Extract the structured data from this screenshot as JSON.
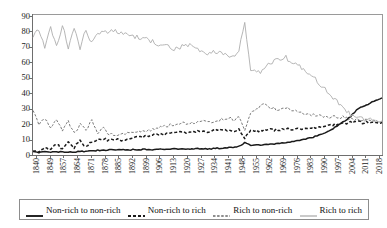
{
  "chart_data": {
    "type": "line",
    "title": "",
    "xlabel": "",
    "ylabel": "",
    "ylim": [
      0,
      90
    ],
    "ytick_values": [
      0,
      10,
      20,
      30,
      40,
      50,
      60,
      70,
      80,
      90
    ],
    "xlim": [
      1840,
      2018
    ],
    "grid": false,
    "legend_position": "bottom",
    "xtick_labels": [
      "1840",
      "1849",
      "1857",
      "1864",
      "1871",
      "1878",
      "1885",
      "1892",
      "1899",
      "1906",
      "1913",
      "1920",
      "1927",
      "1934",
      "1941",
      "1948",
      "1955",
      "1962",
      "1969",
      "1976",
      "1983",
      "1990",
      "1997",
      "2004",
      "2011",
      "2018"
    ],
    "series": [
      {
        "name": "Non-rich to non-rich",
        "style": "solid-thick-dark",
        "color": "#1a1a1a",
        "x": [
          1840,
          1843,
          1846,
          1849,
          1852,
          1855,
          1858,
          1861,
          1864,
          1867,
          1870,
          1873,
          1876,
          1879,
          1882,
          1885,
          1888,
          1891,
          1894,
          1897,
          1900,
          1903,
          1906,
          1909,
          1912,
          1915,
          1918,
          1921,
          1924,
          1927,
          1930,
          1933,
          1936,
          1939,
          1942,
          1945,
          1948,
          1951,
          1954,
          1957,
          1960,
          1963,
          1966,
          1969,
          1972,
          1975,
          1978,
          1981,
          1984,
          1987,
          1990,
          1993,
          1996,
          1999,
          2002,
          2005,
          2008,
          2011,
          2014,
          2018
        ],
        "values": [
          2.0,
          1.8,
          1.9,
          2.0,
          1.8,
          2.0,
          1.9,
          2.1,
          2.2,
          2.4,
          2.6,
          3.0,
          3.2,
          3.3,
          3.2,
          3.4,
          3.3,
          3.5,
          3.4,
          3.6,
          3.5,
          3.7,
          3.6,
          3.8,
          3.9,
          4.0,
          3.8,
          4.0,
          4.1,
          4.2,
          4.0,
          4.3,
          4.4,
          4.6,
          5.0,
          5.4,
          8.0,
          6.2,
          6.4,
          6.6,
          6.8,
          7.0,
          7.4,
          8.0,
          8.6,
          9.4,
          10.2,
          11.0,
          12.0,
          13.5,
          15.0,
          17.0,
          19.5,
          22.0,
          25.0,
          29.0,
          31.5,
          33.0,
          35.0,
          37.0
        ]
      },
      {
        "name": "Non-rich to rich",
        "style": "dashed-thick-dark",
        "color": "#1a1a1a",
        "x": [
          1840,
          1843,
          1846,
          1849,
          1852,
          1855,
          1858,
          1861,
          1864,
          1867,
          1870,
          1873,
          1876,
          1879,
          1882,
          1885,
          1888,
          1891,
          1894,
          1897,
          1900,
          1903,
          1906,
          1909,
          1912,
          1915,
          1918,
          1921,
          1924,
          1927,
          1930,
          1933,
          1936,
          1939,
          1942,
          1945,
          1948,
          1951,
          1954,
          1957,
          1960,
          1963,
          1966,
          1969,
          1972,
          1975,
          1978,
          1981,
          1984,
          1987,
          1990,
          1993,
          1996,
          1999,
          2002,
          2005,
          2008,
          2011,
          2014,
          2018
        ],
        "values": [
          3.0,
          2.0,
          5.0,
          3.5,
          7.0,
          4.0,
          8.0,
          5.0,
          9.0,
          5.5,
          8.5,
          9.5,
          10.5,
          9.5,
          10.0,
          9.5,
          10.5,
          11.0,
          11.5,
          12.0,
          12.5,
          13.5,
          13.0,
          14.0,
          14.5,
          15.0,
          14.0,
          15.0,
          15.5,
          16.0,
          15.0,
          16.0,
          16.5,
          16.0,
          15.5,
          16.5,
          11.0,
          16.0,
          15.5,
          16.0,
          16.5,
          16.0,
          16.5,
          17.0,
          16.5,
          17.0,
          17.0,
          17.5,
          18.0,
          18.5,
          19.0,
          19.5,
          20.0,
          20.5,
          21.0,
          21.5,
          21.0,
          21.5,
          21.0,
          21.0
        ]
      },
      {
        "name": "Rich to non-rich",
        "style": "dashed-thin-gray",
        "color": "#6a6a6a",
        "x": [
          1840,
          1843,
          1846,
          1849,
          1852,
          1855,
          1858,
          1861,
          1864,
          1867,
          1870,
          1873,
          1876,
          1879,
          1882,
          1885,
          1888,
          1891,
          1894,
          1897,
          1900,
          1903,
          1906,
          1909,
          1912,
          1915,
          1918,
          1921,
          1924,
          1927,
          1930,
          1933,
          1936,
          1939,
          1942,
          1945,
          1948,
          1951,
          1954,
          1957,
          1960,
          1963,
          1966,
          1969,
          1972,
          1975,
          1978,
          1981,
          1984,
          1987,
          1990,
          1993,
          1996,
          1999,
          2002,
          2005,
          2008,
          2011,
          2014,
          2018
        ],
        "values": [
          28.0,
          20.0,
          24.0,
          17.0,
          23.0,
          15.0,
          22.0,
          14.0,
          20.0,
          16.0,
          22.0,
          14.0,
          18.0,
          13.0,
          13.5,
          13.0,
          14.0,
          14.5,
          15.0,
          15.5,
          16.0,
          17.0,
          18.0,
          19.0,
          20.0,
          21.0,
          20.0,
          21.0,
          22.0,
          23.0,
          21.0,
          22.0,
          23.0,
          24.0,
          23.0,
          24.5,
          15.0,
          27.0,
          30.0,
          33.0,
          31.0,
          30.0,
          29.0,
          31.0,
          29.0,
          28.0,
          27.0,
          26.0,
          25.5,
          25.0,
          24.0,
          24.5,
          25.0,
          24.0,
          23.5,
          23.0,
          22.5,
          22.0,
          22.0,
          22.0
        ]
      },
      {
        "name": "Rich to rich",
        "style": "solid-thin-lightgray",
        "color": "#aeaeae",
        "x": [
          1840,
          1843,
          1846,
          1849,
          1852,
          1855,
          1858,
          1861,
          1864,
          1867,
          1870,
          1873,
          1876,
          1879,
          1882,
          1885,
          1888,
          1891,
          1894,
          1897,
          1900,
          1903,
          1906,
          1909,
          1912,
          1915,
          1918,
          1921,
          1924,
          1927,
          1930,
          1933,
          1936,
          1939,
          1942,
          1945,
          1948,
          1951,
          1954,
          1957,
          1960,
          1963,
          1966,
          1969,
          1972,
          1975,
          1978,
          1981,
          1984,
          1987,
          1990,
          1993,
          1996,
          1999,
          2002,
          2005,
          2008,
          2011,
          2014,
          2018
        ],
        "values": [
          76.0,
          82.0,
          70.0,
          83.0,
          71.0,
          84.0,
          70.0,
          83.0,
          69.0,
          81.0,
          72.0,
          80.0,
          79.0,
          81.0,
          80.0,
          79.0,
          78.0,
          77.0,
          76.0,
          75.0,
          74.0,
          72.0,
          71.0,
          70.0,
          69.0,
          70.0,
          72.0,
          71.0,
          68.0,
          67.0,
          66.0,
          67.0,
          66.0,
          65.0,
          64.0,
          68.0,
          85.0,
          55.0,
          53.0,
          54.0,
          58.0,
          61.0,
          62.0,
          63.0,
          60.0,
          58.0,
          55.0,
          52.0,
          49.0,
          45.0,
          41.0,
          37.0,
          33.0,
          29.0,
          26.0,
          24.0,
          23.0,
          23.0,
          22.5,
          22.0
        ]
      }
    ]
  },
  "legend": {
    "items": [
      {
        "label": "Non-rich to non-rich",
        "swatch": "solid-thick-dark-icon"
      },
      {
        "label": "Non-rich to rich",
        "swatch": "dashed-thick-dark-icon"
      },
      {
        "label": "Rich to non-rich",
        "swatch": "dashed-thin-gray-icon"
      },
      {
        "label": "Rich to rich",
        "swatch": "solid-thin-lightgray-icon"
      }
    ]
  }
}
